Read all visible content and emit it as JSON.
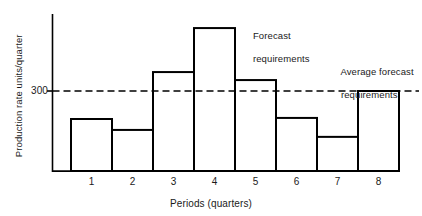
{
  "chart_data": {
    "type": "bar",
    "title": "",
    "xlabel": "Periods (quarters)",
    "ylabel": "Production rate units/quarter",
    "categories": [
      "1",
      "2",
      "3",
      "4",
      "5",
      "6",
      "7",
      "8"
    ],
    "values": [
      195,
      154,
      371,
      536,
      341,
      199,
      128,
      300
    ],
    "ylim": [
      0,
      640
    ],
    "xlim": [
      0.5,
      8.5
    ],
    "ytick_labels": [
      "300"
    ],
    "ytick_values": [
      300
    ],
    "grid": false,
    "legend_position": "none",
    "reference_lines": [
      {
        "name": "average-forecast-requirements",
        "value": 300,
        "style": "dashed",
        "label": "Average forecast\nrequirements"
      }
    ],
    "annotations": [
      {
        "name": "forecast-requirements",
        "text_line1": "Forecast",
        "text_line2": "requirements",
        "target_bar": 4
      },
      {
        "name": "average-forecast-requirements",
        "text_line1": "Average forecast",
        "text_line2": "requirements",
        "target_bar": 8
      }
    ],
    "series_style": {
      "fill": "#ffffff",
      "stroke": "#000000",
      "stroke_width": 2
    },
    "colors": {
      "axis": "#000000",
      "bar_outline": "#000000",
      "bar_fill": "#ffffff",
      "reference_line": "#000000",
      "text": "#1a1a1a",
      "background": "#ffffff"
    }
  },
  "axes": {
    "y_label": "Production rate units/quarter",
    "y_tick_300": "300",
    "x_title": "Periods (quarters)",
    "x_tick_labels": [
      "1",
      "2",
      "3",
      "4",
      "5",
      "6",
      "7",
      "8"
    ]
  },
  "annotations": {
    "forecast_line1": "Forecast",
    "forecast_line2": "requirements",
    "average_line1": "Average forecast",
    "average_line2": "requirements"
  }
}
